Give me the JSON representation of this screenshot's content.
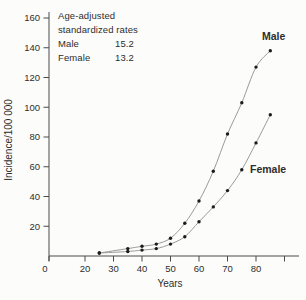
{
  "figure": {
    "background": "#fcfcfb",
    "text_color": "#2e2e2e",
    "axis_color": "#4a4a4a",
    "curve_color": "#9a9a9a",
    "point_color": "#1b1b1b"
  },
  "legend": {
    "line1": "Age-adjusted",
    "line2": "standardized rates",
    "rows": [
      {
        "label": "Male",
        "value": "15.2"
      },
      {
        "label": "Female",
        "value": "13.2"
      }
    ]
  },
  "chart_data": {
    "type": "line",
    "title": "",
    "xlabel": "Years",
    "ylabel": "Incidence/100 000",
    "x_ticks": [
      0,
      20,
      30,
      40,
      50,
      60,
      70,
      80
    ],
    "x_unlabeled_ticks": [
      90
    ],
    "y_ticks": [
      20,
      40,
      60,
      80,
      100,
      120,
      140,
      160
    ],
    "xlim": [
      0,
      90
    ],
    "ylim": [
      0,
      160
    ],
    "grid": false,
    "legend_position": "top-left",
    "series": [
      {
        "name": "Male",
        "x": [
          25,
          35,
          40,
          45,
          50,
          55,
          60,
          65,
          70,
          75,
          80,
          85
        ],
        "values": [
          2,
          5,
          6.5,
          8,
          12,
          22,
          37,
          57,
          82,
          103,
          127,
          138
        ]
      },
      {
        "name": "Female",
        "x": [
          25,
          35,
          40,
          45,
          50,
          55,
          60,
          65,
          70,
          75,
          80,
          85
        ],
        "values": [
          2,
          3,
          4,
          5,
          8,
          13,
          23,
          33,
          44,
          58,
          76,
          95
        ]
      }
    ]
  }
}
